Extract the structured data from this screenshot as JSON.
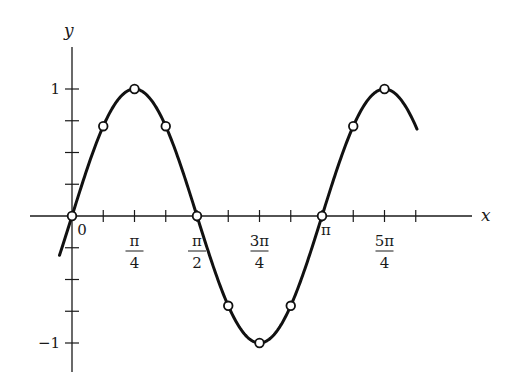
{
  "chart_data": {
    "type": "line",
    "title": "",
    "function": "y = sin(2x)",
    "xlabel": "x",
    "ylabel": "y",
    "xlim": [
      -0.05,
      1.38
    ],
    "xlim_units": "multiples of pi",
    "ylim": [
      -1.2,
      1.35
    ],
    "grid": false,
    "legend": null,
    "x_ticks_step_pi": 0.125,
    "y_ticks_step": 0.25,
    "x_tick_labels": [
      {
        "value_pi": 0,
        "label": "0"
      },
      {
        "value_pi": 0.25,
        "label_num": "π",
        "label_den": "4"
      },
      {
        "value_pi": 0.5,
        "label_num": "π",
        "label_den": "2"
      },
      {
        "value_pi": 0.75,
        "label_num": "3π",
        "label_den": "4"
      },
      {
        "value_pi": 1.0,
        "label": "π"
      },
      {
        "value_pi": 1.25,
        "label_num": "5π",
        "label_den": "4"
      }
    ],
    "y_tick_labels": [
      {
        "value": 1,
        "label": "1"
      },
      {
        "value": -1,
        "label": "−1"
      }
    ],
    "series": [
      {
        "name": "sin(2x)",
        "style": "solid thick black curve with open circle markers",
        "x_pi": [
          0,
          0.125,
          0.25,
          0.375,
          0.5,
          0.625,
          0.75,
          0.875,
          1.0,
          1.125,
          1.25
        ],
        "y": [
          0,
          0.707,
          1,
          0.707,
          0,
          -0.707,
          -1,
          -0.707,
          0,
          0.707,
          1
        ]
      }
    ]
  }
}
